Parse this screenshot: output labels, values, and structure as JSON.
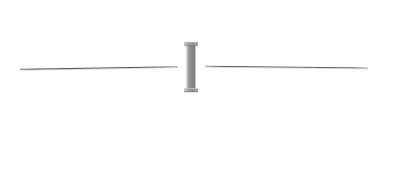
{
  "canvas": {
    "width": 394,
    "height": 178,
    "background": "#ffffff",
    "title": "I-beam divider schematic"
  },
  "palette": {
    "background": "#ffffff",
    "line_stroke": "#595959",
    "line_stroke_soft": "#8c8c8c",
    "bar_fill": "#8a8a8a",
    "bar_fill_light": "#b5b5b5",
    "bar_fill_dark": "#7a7a7a",
    "cap_fill": "#9a9a9a",
    "cap_edge": "#6e6e6e"
  },
  "elements": {
    "left_rule": {
      "name": "left horizontal rule",
      "x1": 20,
      "y1": 69.4,
      "x2": 178,
      "y2": 66.8,
      "stroke": "#595959",
      "stroke_width": 1.1
    },
    "right_rule": {
      "name": "right horizontal rule",
      "x1": 205,
      "y1": 66.2,
      "x2": 368,
      "y2": 68.0,
      "stroke": "#595959",
      "stroke_width": 1.1
    },
    "center_bar": {
      "name": "vertical I-beam handle",
      "x": 186.5,
      "y": 42,
      "width": 9,
      "height": 50,
      "fill": "#8a8a8a"
    },
    "top_cap": {
      "name": "top cap flange",
      "x": 184,
      "y": 42,
      "width": 14,
      "height": 3.5,
      "fill": "#9a9a9a"
    },
    "bottom_cap": {
      "name": "bottom cap flange",
      "x": 184,
      "y": 88.5,
      "width": 14,
      "height": 3.5,
      "fill": "#9a9a9a"
    },
    "left_gap": {
      "name": "gap between left rule and bar",
      "from": 178,
      "to": 186.5
    },
    "right_gap": {
      "name": "gap between bar and right rule",
      "from": 195.5,
      "to": 205
    }
  }
}
